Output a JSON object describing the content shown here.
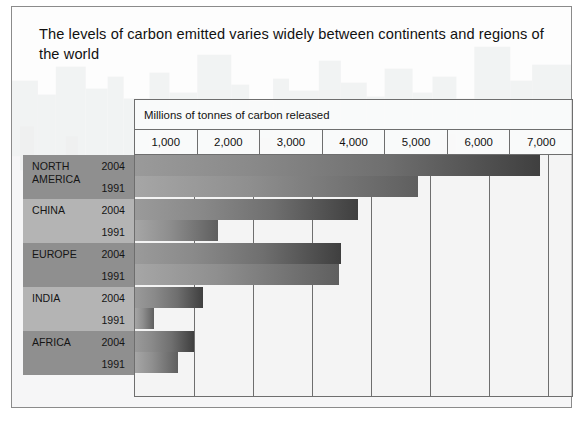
{
  "title": "The levels of carbon emitted varies widely between continents and regions of the world",
  "chart_data": {
    "type": "bar",
    "orientation": "horizontal",
    "title": "The levels of carbon emitted varies widely between continents and regions of the world",
    "xlabel": "Millions of tonnes of carbon released",
    "ylabel": "",
    "xlim": [
      0,
      7400
    ],
    "tick_labels": [
      "1,000",
      "2,000",
      "3,000",
      "4,000",
      "5,000",
      "6,000",
      "7,000"
    ],
    "tick_values": [
      1000,
      2000,
      3000,
      4000,
      5000,
      6000,
      7000
    ],
    "grid": true,
    "legend": "none",
    "categories": [
      "NORTH AMERICA",
      "CHINA",
      "EUROPE",
      "INDIA",
      "AFRICA"
    ],
    "series": [
      {
        "name": "2004",
        "values": [
          6850,
          3780,
          3480,
          1150,
          1000
        ]
      },
      {
        "name": "1991",
        "values": [
          4800,
          1400,
          3450,
          330,
          730
        ]
      }
    ],
    "rows": [
      {
        "continent": "NORTH AMERICA",
        "year_top": "2004",
        "year_bottom": "1991",
        "value_top": 6850,
        "value_bottom": 4800
      },
      {
        "continent": "CHINA",
        "year_top": "2004",
        "year_bottom": "1991",
        "value_top": 3780,
        "value_bottom": 1400
      },
      {
        "continent": "EUROPE",
        "year_top": "2004",
        "year_bottom": "1991",
        "value_top": 3480,
        "value_bottom": 3450
      },
      {
        "continent": "INDIA",
        "year_top": "2004",
        "year_bottom": "1991",
        "value_top": 1150,
        "value_bottom": 330
      },
      {
        "continent": "AFRICA",
        "year_top": "2004",
        "year_bottom": "1991",
        "value_top": 1000,
        "value_bottom": 730
      }
    ]
  },
  "colors": {
    "frame_border": "#8b8b8b",
    "grid_line": "#6e6e6e",
    "bar_dark": "#3f3f3f",
    "bar_light": "#9a9a9a",
    "band_dark": "#8f8f8f",
    "band_light": "#b4b4b4",
    "text": "#111111"
  }
}
